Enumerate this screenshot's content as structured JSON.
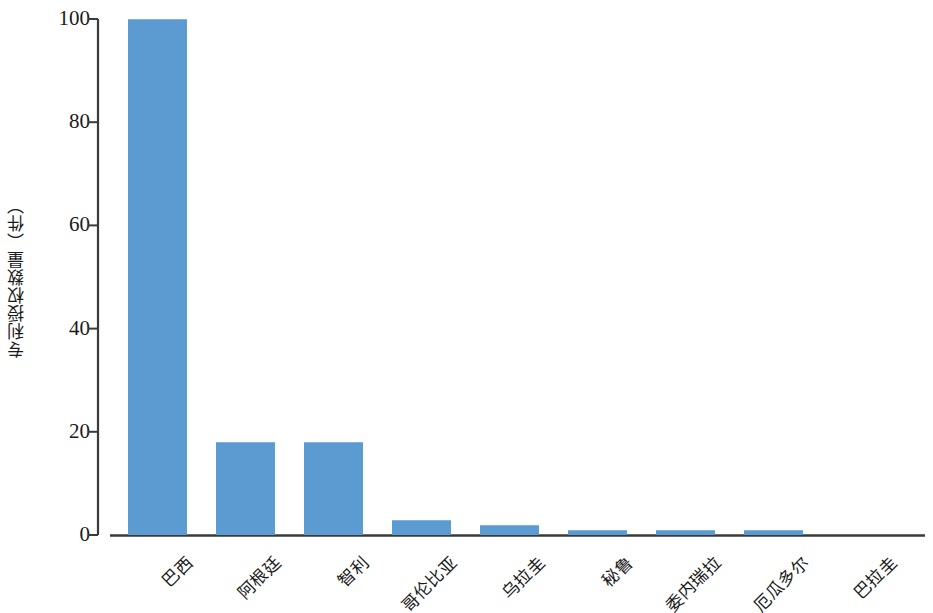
{
  "chart_data": {
    "type": "bar",
    "title": "",
    "subtitle": "",
    "xlabel": "",
    "ylabel": "专利授权数量（件）",
    "categories": [
      "巴西",
      "阿根廷",
      "智利",
      "哥伦比亚",
      "乌拉圭",
      "秘鲁",
      "委内瑞拉",
      "厄瓜多尔",
      "巴拉圭"
    ],
    "values": [
      100,
      18,
      18,
      3,
      2,
      1,
      1,
      1,
      0
    ],
    "ylim": [
      0,
      100
    ],
    "yticks": [
      0,
      20,
      40,
      60,
      80,
      100
    ],
    "ytick_labels": [
      "0",
      "20",
      "40",
      "60",
      "80",
      "100"
    ],
    "grid": false,
    "legend": null,
    "bar_color": "#5b9bd1",
    "axis_color": "#3a3a38",
    "background_color": "#ffffff"
  },
  "axis": {
    "y_title": "专利授权数量（件）"
  }
}
